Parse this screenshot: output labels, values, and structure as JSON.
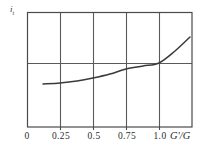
{
  "chart_data": {
    "type": "line",
    "title": "",
    "xlabel": "G'/G",
    "ylabel": "i",
    "ylabel_sub": "t",
    "xlim": [
      0,
      1.25
    ],
    "ylim": [
      0,
      1
    ],
    "grid": true,
    "legend": null,
    "xticks": [
      {
        "value": 0,
        "label": "0",
        "px": 27
      },
      {
        "value": 0.25,
        "label": "0.25",
        "px": 60
      },
      {
        "value": 0.5,
        "label": "0.5",
        "px": 93
      },
      {
        "value": 0.75,
        "label": "0.75",
        "px": 126
      },
      {
        "value": 1.0,
        "label": "1.0",
        "px": 159
      }
    ],
    "yticks": [],
    "gridlines": {
      "vertical_px": [
        27,
        60,
        93,
        126,
        159,
        192
      ],
      "horizontal_px": [
        12,
        63,
        127
      ]
    },
    "series": [
      {
        "name": "i_t curve",
        "color": "#3c3a38",
        "x": [
          0.12,
          0.25,
          0.38,
          0.5,
          0.62,
          0.75,
          0.88,
          1.0,
          1.12,
          1.24
        ],
        "y": [
          0.375,
          0.385,
          0.402,
          0.425,
          0.455,
          0.495,
          0.545,
          0.558,
          0.66,
          0.783
        ],
        "points_px": [
          [
            43,
            84
          ],
          [
            60,
            83
          ],
          [
            77,
            81
          ],
          [
            93,
            78
          ],
          [
            110,
            74
          ],
          [
            126,
            69
          ],
          [
            143,
            66
          ],
          [
            159,
            63
          ],
          [
            175,
            51
          ],
          [
            190,
            37
          ]
        ]
      }
    ],
    "frame_px": {
      "left": 27,
      "right": 192,
      "top": 12,
      "bottom": 127
    },
    "colors": {
      "frame": "#4a4a4a",
      "grid": "#5a5a5a",
      "curve": "#3c3a38",
      "text": "#2b2b2b",
      "background": "#ffffff"
    }
  }
}
